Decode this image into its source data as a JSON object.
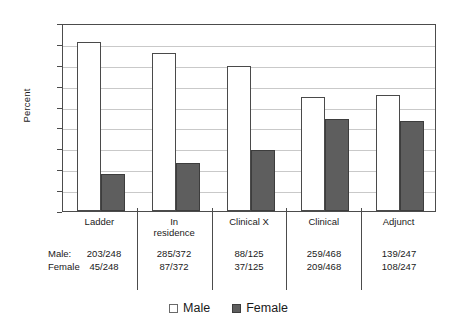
{
  "chart_data": {
    "type": "bar",
    "title": "",
    "subtitle": "",
    "xlabel": "",
    "ylabel": "Percent",
    "ylim": [
      0,
      90
    ],
    "ytick_labels": [
      "0",
      "10",
      "20",
      "30",
      "40",
      "50",
      "60",
      "70",
      "80",
      "90"
    ],
    "ytick_values": [
      0,
      10,
      20,
      30,
      40,
      50,
      60,
      70,
      80,
      90
    ],
    "grid": true,
    "legend_position": "bottom-center",
    "categories": [
      "Ladder",
      "In residence",
      "Clinical X",
      "Clinical",
      "Adjunct"
    ],
    "category_label_lines": [
      [
        "Ladder"
      ],
      [
        "In",
        "residence"
      ],
      [
        "Clinical X"
      ],
      [
        "Clinical"
      ],
      [
        "Adjunct"
      ]
    ],
    "series": [
      {
        "name": "Male",
        "color": "#ffffff",
        "values": [
          81.9,
          76.6,
          70.4,
          55.3,
          56.3
        ]
      },
      {
        "name": "Female",
        "color": "#5e5e5e",
        "values": [
          18.1,
          23.4,
          29.6,
          44.7,
          43.7
        ]
      }
    ],
    "annotations": {
      "row_labels": [
        "Male:",
        "Female"
      ],
      "rows": [
        {
          "label": "Male:",
          "fractions": [
            "203/248",
            "285/372",
            "88/125",
            "259/468",
            "139/247"
          ]
        },
        {
          "label": "Female",
          "fractions": [
            "45/248",
            "87/372",
            "37/125",
            "209/468",
            "108/247"
          ]
        }
      ]
    }
  },
  "legend": {
    "items": [
      {
        "label": "Male",
        "swatch": "white-square-icon"
      },
      {
        "label": "Female",
        "swatch": "gray-square-icon"
      }
    ]
  },
  "colors": {
    "male_fill": "#ffffff",
    "female_fill": "#5e5e5e",
    "axis": "#4c4c4c",
    "gridline": "#c9c9c9",
    "text": "#1a1a1a"
  }
}
